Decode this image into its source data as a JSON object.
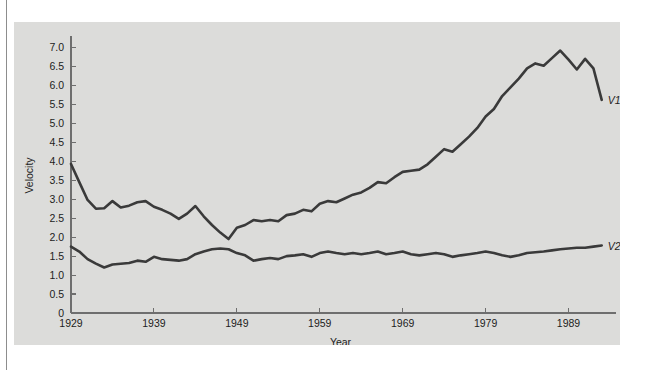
{
  "figure": {
    "background_color": "#dcdcda",
    "page_color": "#ffffff",
    "line_color": "#3a3a3a",
    "axis_color": "#6e6e6e"
  },
  "chart_data": {
    "type": "line",
    "title": "",
    "subtitle": "",
    "xlabel": "Year",
    "ylabel": "Velocity",
    "xlim": [
      1929,
      1994
    ],
    "ylim": [
      0,
      7.25
    ],
    "grid": false,
    "legend_position": "right-of-line-ends",
    "x_ticks": [
      1929,
      1939,
      1949,
      1959,
      1969,
      1979,
      1989
    ],
    "x_tick_labels": [
      "1929",
      "1939",
      "1949",
      "1959",
      "1969",
      "1979",
      "1989"
    ],
    "y_ticks": [
      0,
      0.5,
      1.0,
      1.5,
      2.0,
      2.5,
      3.0,
      3.5,
      4.0,
      4.5,
      5.0,
      5.5,
      6.0,
      6.5,
      7.0
    ],
    "y_tick_labels": [
      "0",
      "0.5",
      "1.0",
      "1.5",
      "2.0",
      "2.5",
      "3.0",
      "3.5",
      "4.0",
      "4.5",
      "5.0",
      "5.5",
      "6.0",
      "6.5",
      "7.0"
    ],
    "x": [
      1929,
      1930,
      1931,
      1932,
      1933,
      1934,
      1935,
      1936,
      1937,
      1938,
      1939,
      1940,
      1941,
      1942,
      1943,
      1944,
      1945,
      1946,
      1947,
      1948,
      1949,
      1950,
      1951,
      1952,
      1953,
      1954,
      1955,
      1956,
      1957,
      1958,
      1959,
      1960,
      1961,
      1962,
      1963,
      1964,
      1965,
      1966,
      1967,
      1968,
      1969,
      1970,
      1971,
      1972,
      1973,
      1974,
      1975,
      1976,
      1977,
      1978,
      1979,
      1980,
      1981,
      1982,
      1983,
      1984,
      1985,
      1986,
      1987,
      1988,
      1989,
      1990,
      1991,
      1992,
      1993
    ],
    "series": [
      {
        "name": "V1",
        "label": "V1",
        "values": [
          3.93,
          3.45,
          2.98,
          2.75,
          2.76,
          2.95,
          2.78,
          2.83,
          2.92,
          2.95,
          2.8,
          2.72,
          2.62,
          2.48,
          2.62,
          2.82,
          2.55,
          2.32,
          2.12,
          1.95,
          2.25,
          2.32,
          2.45,
          2.42,
          2.45,
          2.42,
          2.58,
          2.62,
          2.72,
          2.68,
          2.88,
          2.95,
          2.92,
          3.02,
          3.12,
          3.18,
          3.3,
          3.45,
          3.42,
          3.58,
          3.72,
          3.75,
          3.78,
          3.92,
          4.12,
          4.32,
          4.25,
          4.45,
          4.65,
          4.88,
          5.18,
          5.38,
          5.72,
          5.95,
          6.18,
          6.45,
          6.58,
          6.52,
          6.72,
          6.92,
          6.68,
          6.42,
          6.7,
          6.45,
          5.62
        ]
      },
      {
        "name": "V2",
        "label": "V2",
        "values": [
          1.75,
          1.62,
          1.42,
          1.3,
          1.2,
          1.28,
          1.3,
          1.32,
          1.38,
          1.35,
          1.48,
          1.42,
          1.4,
          1.38,
          1.42,
          1.55,
          1.62,
          1.68,
          1.7,
          1.68,
          1.58,
          1.52,
          1.38,
          1.42,
          1.45,
          1.42,
          1.5,
          1.52,
          1.55,
          1.48,
          1.58,
          1.62,
          1.58,
          1.55,
          1.58,
          1.55,
          1.58,
          1.62,
          1.55,
          1.58,
          1.62,
          1.55,
          1.52,
          1.55,
          1.58,
          1.55,
          1.48,
          1.52,
          1.55,
          1.58,
          1.62,
          1.58,
          1.52,
          1.48,
          1.52,
          1.58,
          1.6,
          1.62,
          1.65,
          1.68,
          1.7,
          1.72,
          1.72,
          1.75,
          1.78
        ]
      }
    ]
  }
}
